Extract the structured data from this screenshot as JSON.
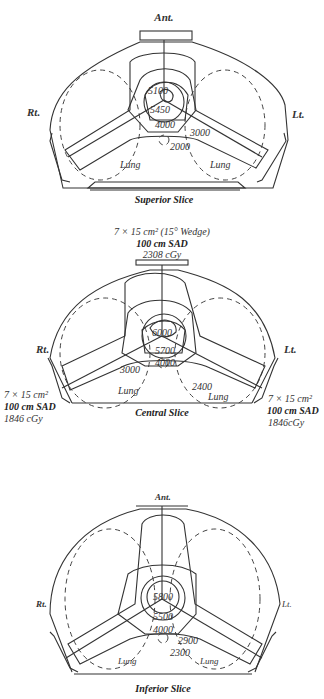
{
  "figure": {
    "panels": [
      {
        "id": "superior",
        "title": "Superior Slice",
        "orientation": {
          "anterior": "Ant.",
          "right": "Rt.",
          "left": "Lt."
        },
        "isodose_labels": [
          "5100",
          "5450",
          "4000",
          "3000",
          "2000"
        ],
        "organ_labels": {
          "left_lung": "Lung",
          "right_lung": "Lung"
        }
      },
      {
        "id": "central",
        "title": "Central Slice",
        "orientation": {
          "right": "Rt.",
          "left": "Lt."
        },
        "isodose_labels": [
          "6000",
          "5700",
          "4000",
          "3000",
          "2400"
        ],
        "organ_labels": {
          "left_lung": "Lung",
          "right_lung": "Lung"
        },
        "beams": {
          "anterior": {
            "field": "7 × 15 cm² (15° Wedge)",
            "sad": "100 cm SAD",
            "dose": "2308 cGy"
          },
          "right_posterior_oblique": {
            "field": "7 × 15 cm²",
            "sad": "100 cm SAD",
            "dose": "1846 cGy"
          },
          "left_posterior_oblique": {
            "field": "7 × 15 cm²",
            "sad": "100 cm SAD",
            "dose": "1846cGy"
          }
        }
      },
      {
        "id": "inferior",
        "title": "Inferior Slice",
        "orientation": {
          "anterior": "Ant.",
          "right": "Rt.",
          "left": "Lt."
        },
        "isodose_labels": [
          "5800",
          "5500",
          "4000",
          "2900",
          "2300"
        ],
        "organ_labels": {
          "left_lung": "Lung",
          "right_lung": "Lung"
        }
      }
    ]
  }
}
